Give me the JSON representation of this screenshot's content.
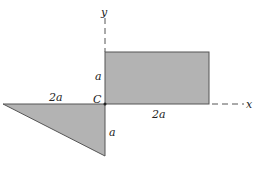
{
  "diagram": {
    "axes": {
      "x_label": "x",
      "y_label": "y"
    },
    "origin_label": "C",
    "rectangle": {
      "width_label": "2a",
      "height_label": "a",
      "fill": "#b3b3b3",
      "stroke": "#555555"
    },
    "triangle": {
      "base_label": "2a",
      "height_label": "a",
      "fill": "#b3b3b3",
      "stroke": "#555555"
    },
    "colors": {
      "background": "#ffffff",
      "axis": "#555555",
      "text": "#222222"
    }
  }
}
